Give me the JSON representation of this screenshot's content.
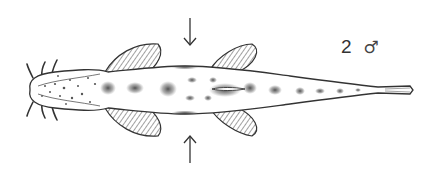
{
  "figure": {
    "specimen_label": {
      "number": "2",
      "sex_symbol": "♂"
    },
    "arrows": [
      "down",
      "up"
    ],
    "colors": {
      "ink": "#333333",
      "spot": "#555555",
      "background": "#ffffff"
    }
  }
}
